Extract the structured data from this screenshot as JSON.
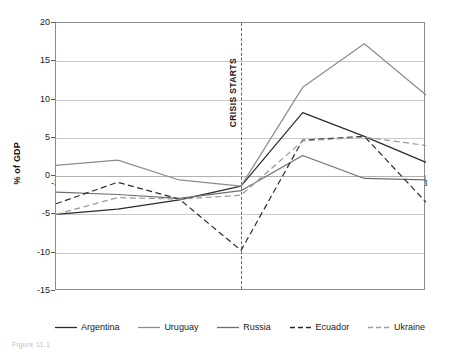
{
  "chart_data": {
    "type": "line",
    "title": "",
    "subtitle": "",
    "xlabel": "",
    "ylabel": "% of GDP",
    "x": [
      -3,
      -2,
      -1,
      0,
      1,
      2,
      3
    ],
    "xticklabels": [
      "-3",
      "-2",
      "-1",
      "0",
      "1",
      "2",
      "3"
    ],
    "yticklabels": [
      "20",
      "15",
      "10",
      "5",
      "0",
      "-5",
      "-10",
      "-15"
    ],
    "yticks": [
      20,
      15,
      10,
      5,
      0,
      -5,
      -10,
      -15
    ],
    "xlim": [
      -3,
      3
    ],
    "ylim": [
      -15,
      20
    ],
    "grid": "horizontal",
    "legend_position": "bottom",
    "series": [
      {
        "name": "Argentina",
        "style": "solid",
        "color": "#2b2b2b",
        "values": [
          -5.0,
          -4.3,
          -3.1,
          -1.3,
          8.3,
          5.2,
          1.8
        ]
      },
      {
        "name": "Uruguay",
        "style": "solid",
        "color": "#8c8c8c",
        "values": [
          1.4,
          2.1,
          -0.5,
          -1.3,
          11.6,
          17.3,
          10.6
        ]
      },
      {
        "name": "Russia",
        "style": "solid",
        "color": "#6e6e6e",
        "values": [
          -2.1,
          -2.4,
          -2.9,
          -1.9,
          2.7,
          -0.3,
          -0.5
        ]
      },
      {
        "name": "Ecuador",
        "style": "dashed",
        "color": "#2b2b2b",
        "values": [
          -3.6,
          -0.8,
          -3.0,
          -9.7,
          4.7,
          5.2,
          -3.4
        ]
      },
      {
        "name": "Ukraine",
        "style": "dashed",
        "color": "#9a9a9a",
        "values": [
          -5.0,
          -2.8,
          -3.0,
          -2.5,
          4.6,
          5.1,
          4.0
        ]
      }
    ],
    "annotations": [
      {
        "text": "CRISIS STARTS",
        "x": 0,
        "orientation": "vertical",
        "line": "dashed"
      }
    ]
  },
  "caption": {
    "text": "Figure 11.1"
  }
}
